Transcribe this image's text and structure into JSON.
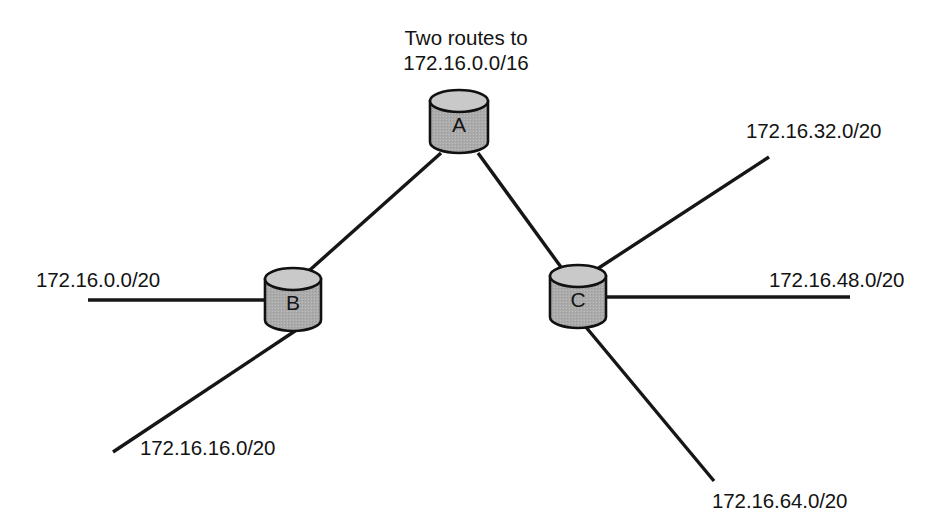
{
  "diagram": {
    "title_line1": "Two routes to",
    "title_line2": "172.16.0.0/16",
    "nodes": [
      {
        "id": "A",
        "label": "A",
        "role": "core-router",
        "x": 459,
        "y": 122
      },
      {
        "id": "B",
        "label": "B",
        "role": "edge-router",
        "x": 293,
        "y": 300
      },
      {
        "id": "C",
        "label": "C",
        "role": "edge-router",
        "x": 578,
        "y": 297
      }
    ],
    "node_fill_color": "#ababab",
    "node_top_color": "#c9c9c9",
    "node_stroke_color": "#111111",
    "line_color": "#161616",
    "background_color": "#ffffff",
    "links": [
      {
        "from": "A",
        "to": "B",
        "label": ""
      },
      {
        "from": "A",
        "to": "C",
        "label": ""
      }
    ],
    "networks": [
      {
        "id": "net-b-left",
        "label": "172.16.0.0/20",
        "attached_to": "B",
        "direction": "left"
      },
      {
        "id": "net-b-downleft",
        "label": "172.16.16.0/20",
        "attached_to": "B",
        "direction": "down-left"
      },
      {
        "id": "net-c-upright",
        "label": "172.16.32.0/20",
        "attached_to": "C",
        "direction": "up-right"
      },
      {
        "id": "net-c-right",
        "label": "172.16.48.0/20",
        "attached_to": "C",
        "direction": "right"
      },
      {
        "id": "net-c-downright",
        "label": "172.16.64.0/20",
        "attached_to": "C",
        "direction": "down-right"
      }
    ],
    "aggregate_route": "172.16.0.0/16"
  }
}
